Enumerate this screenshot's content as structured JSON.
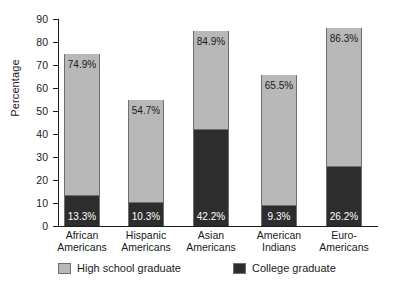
{
  "chart_data": {
    "type": "bar",
    "subtype": "stacked-bar",
    "title": "",
    "xlabel": "",
    "ylabel": "Percentage",
    "ylim": [
      0,
      90
    ],
    "ytick_step": 10,
    "yticks": [
      90,
      80,
      70,
      60,
      50,
      40,
      30,
      20,
      10,
      0
    ],
    "grid": false,
    "legend_position": "bottom",
    "categories": [
      "African Americans",
      "Hispanic Americans",
      "Asian Americans",
      "American Indians",
      "Euro-Americans"
    ],
    "category_lines": [
      [
        "African",
        "Americans"
      ],
      [
        "Hispanic",
        "Americans"
      ],
      [
        "Asian",
        "Americans"
      ],
      [
        "American",
        "Indians"
      ],
      [
        "Euro-",
        "Americans"
      ]
    ],
    "series": [
      {
        "name": "High school graduate",
        "color": "#b8b8b8",
        "values": [
          74.9,
          54.7,
          84.9,
          65.5,
          86.3
        ],
        "labels": [
          "74.9%",
          "54.7%",
          "84.9%",
          "65.5%",
          "86.3%"
        ]
      },
      {
        "name": "College graduate",
        "color": "#2d2d2d",
        "values": [
          13.3,
          10.3,
          42.2,
          9.3,
          26.2
        ],
        "labels": [
          "13.3%",
          "10.3%",
          "42.2%",
          "9.3%",
          "26.2%"
        ]
      }
    ],
    "note": "High school graduate value is the bar total; College graduate is the dark sub-portion measured from zero."
  },
  "axis": {
    "y_title": "Percentage",
    "tick_labels": [
      "90",
      "80",
      "70",
      "60",
      "50",
      "40",
      "30",
      "20",
      "10",
      "0"
    ]
  },
  "legend": {
    "items": [
      {
        "label": "High school graduate",
        "color": "#b8b8b8"
      },
      {
        "label": "College graduate",
        "color": "#2d2d2d"
      }
    ]
  },
  "colors": {
    "high_school": "#b8b8b8",
    "college": "#2d2d2d",
    "axis": "#1a1a1a",
    "bar_border": "#6e6e6e",
    "background": "#ffffff"
  }
}
